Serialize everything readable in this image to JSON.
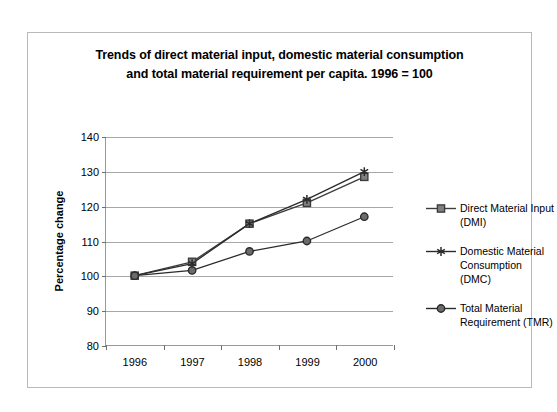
{
  "chart_data": {
    "type": "line",
    "title": "Trends of direct material input, domestic material consumption and total material requirement per capita. 1996 = 100",
    "title_lines": [
      "Trends of direct material input, domestic material consumption",
      "and total material requirement per capita. 1996 = 100"
    ],
    "xlabel": "",
    "ylabel": "Percentage change",
    "categories": [
      "1996",
      "1997",
      "1998",
      "1999",
      "2000"
    ],
    "x": [
      1996,
      1997,
      1998,
      1999,
      2000
    ],
    "ylim": [
      80,
      140
    ],
    "yticks": [
      80,
      90,
      100,
      110,
      120,
      130,
      140
    ],
    "grid": true,
    "legend_position": "right",
    "series": [
      {
        "name": "Direct Material Input (DMI)",
        "name_lines": [
          "Direct Material Input",
          "(DMI)"
        ],
        "marker": "square",
        "color": "#3d3d3d",
        "marker_fill": "#808080",
        "values": [
          100,
          104,
          115,
          121,
          128.5
        ]
      },
      {
        "name": "Domestic Material Consumption (DMC)",
        "name_lines": [
          "Domestic Material",
          "Consumption (DMC)"
        ],
        "marker": "asterisk",
        "color": "#2b2b2b",
        "marker_fill": "#2b2b2b",
        "values": [
          100,
          103.5,
          115,
          122,
          130
        ]
      },
      {
        "name": "Total Material Requirement (TMR)",
        "name_lines": [
          "Total Material",
          "Requirement (TMR)"
        ],
        "marker": "circle",
        "color": "#2b2b2b",
        "marker_fill": "#6b6b6b",
        "values": [
          100,
          101.5,
          107,
          110,
          117
        ]
      }
    ]
  }
}
